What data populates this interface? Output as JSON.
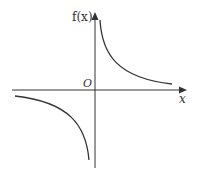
{
  "figure": {
    "type": "function-graph",
    "y_axis_label": "f(x)",
    "x_axis_label": "x",
    "origin_label": "O",
    "curve_color": "#333333",
    "axis_color": "#333333"
  }
}
